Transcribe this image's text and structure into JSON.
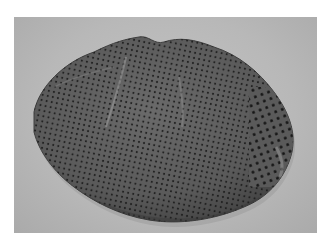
{
  "image": {
    "subject": "fossil specimen with honeycomb-like pore pattern",
    "description": "Oval dark grey fossil slab covered in a regular grid of small dark pores on a light grey background, framed by a white border",
    "colors": {
      "border": "#ffffff",
      "background": "#bdbdbd",
      "fossil_body": "#5e5e5e",
      "fossil_edge": "#4a4a4a",
      "pores": "#1e1e1e",
      "highlight": "#8a8a8a"
    }
  }
}
